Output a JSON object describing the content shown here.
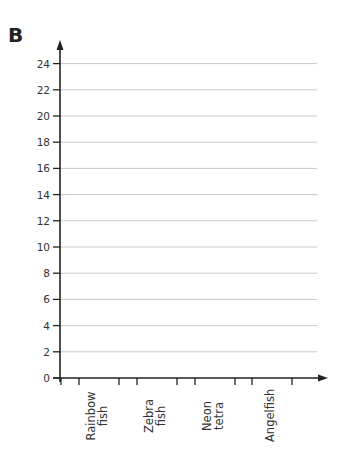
{
  "panel_label": "B",
  "chart_data": {
    "type": "bar",
    "title": "",
    "xlabel": "",
    "ylabel": "",
    "categories": [
      "Rainbow fish",
      "Zebra fish",
      "Neon tetra",
      "Angelfish"
    ],
    "category_lines": [
      [
        "Rainbow",
        "fish"
      ],
      [
        "Zebra",
        "fish"
      ],
      [
        "Neon",
        "tetra"
      ],
      [
        "Angelfish"
      ]
    ],
    "values": [
      null,
      null,
      null,
      null
    ],
    "yticks": [
      0,
      2,
      4,
      6,
      8,
      10,
      12,
      14,
      16,
      18,
      20,
      22,
      24
    ],
    "ylim": [
      0,
      24
    ],
    "grid": true,
    "legend": null,
    "note": "Empty chart template — no bars drawn"
  },
  "colors": {
    "axis": "#222222",
    "grid": "#c8c8c8",
    "text": "#333333"
  }
}
